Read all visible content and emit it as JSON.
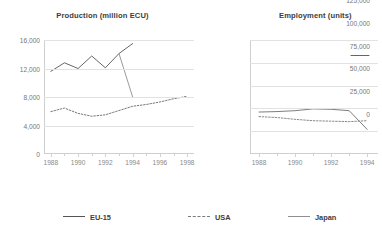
{
  "legend": {
    "position": "bottom",
    "entries": [
      {
        "label": "EU-15",
        "style": "solid",
        "color": "#555555"
      },
      {
        "label": "USA",
        "style": "dashed",
        "color": "#7a7a7a"
      },
      {
        "label": "Japan",
        "style": "solid",
        "color": "#8f8f8f"
      }
    ]
  },
  "chart_data": [
    {
      "type": "line",
      "title": "Production (million ECU)",
      "xlabel": "",
      "ylabel": "",
      "xlim": [
        1987.5,
        1998.5
      ],
      "ylim": [
        0,
        16000
      ],
      "yticks": [
        0,
        4000,
        8000,
        12000,
        16000
      ],
      "ytick_labels": [
        "0",
        "4,000",
        "8,000",
        "12,000",
        "16,000"
      ],
      "xticks": [
        1988,
        1990,
        1992,
        1994,
        1996,
        1998
      ],
      "xtick_labels": [
        "1988",
        "1990",
        "1992",
        "1994",
        "1996",
        "1998"
      ],
      "grid": true,
      "series": [
        {
          "name": "EU-15",
          "style": "solid",
          "color": "#555555",
          "x": [
            1988,
            1989,
            1990,
            1991,
            1992,
            1993,
            1994
          ],
          "values": [
            11600,
            12800,
            12000,
            13750,
            12100,
            14100,
            15500
          ]
        },
        {
          "name": "USA",
          "style": "dashed",
          "color": "#7a7a7a",
          "x": [
            1988,
            1989,
            1990,
            1991,
            1992,
            1993,
            1994,
            1995,
            1996,
            1997,
            1998
          ],
          "values": [
            5950,
            6450,
            5700,
            5300,
            5500,
            6100,
            6700,
            6950,
            7300,
            7750,
            8100
          ]
        },
        {
          "name": "Japan",
          "style": "solid",
          "color": "#8f8f8f",
          "x": [
            1993,
            1994
          ],
          "values": [
            14100,
            8000
          ]
        }
      ]
    },
    {
      "type": "line",
      "title": "Employment (units)",
      "xlabel": "",
      "ylabel": "",
      "xlim": [
        1987.5,
        1994.6
      ],
      "ylim": [
        0,
        125000
      ],
      "yticks": [
        0,
        25000,
        50000,
        75000,
        100000,
        125000
      ],
      "ytick_labels": [
        "0",
        "25,000",
        "50,000",
        "75,000",
        "100,000",
        "125,000"
      ],
      "xticks": [
        1988,
        1990,
        1992,
        1994
      ],
      "xtick_labels": [
        "1988",
        "1990",
        "1992",
        "1994"
      ],
      "grid": true,
      "clipped_right_edge": true,
      "series": [
        {
          "name": "EU-15",
          "style": "solid",
          "color": "#6e6e6e",
          "x": [
            1988,
            1989,
            1990,
            1991,
            1992,
            1993,
            1994
          ],
          "values": [
            46000,
            46500,
            47500,
            49500,
            49000,
            47500,
            27000
          ]
        },
        {
          "name": "USA",
          "style": "dashed",
          "color": "#8a8a8a",
          "x": [
            1988,
            1989,
            1990,
            1991,
            1992,
            1993,
            1994
          ],
          "values": [
            41000,
            40000,
            38000,
            36500,
            36000,
            35500,
            36500
          ]
        },
        {
          "name": "Japan",
          "style": "solid",
          "color": "#555555",
          "x": [
            1993.1,
            1994.1
          ],
          "values": [
            108000,
            108000
          ]
        }
      ]
    }
  ]
}
